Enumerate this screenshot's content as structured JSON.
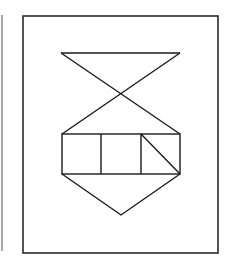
{
  "diagram": {
    "colors": {
      "stroke": "#1a1a1a",
      "frame": "#2a2a2a",
      "left_rule": "#a8a8a8",
      "background": "#ffffff"
    },
    "frame": {
      "x": 23,
      "y": 16,
      "width": 195,
      "height": 237
    },
    "shapes": {
      "top_bar": {
        "x1": 61,
        "y1": 53,
        "x2": 180,
        "y2": 53
      },
      "diagonal_left_to_right": {
        "x1": 61,
        "y1": 53,
        "x2": 180,
        "y2": 134
      },
      "diagonal_right_to_left": {
        "x1": 180,
        "y1": 53,
        "x2": 62,
        "y2": 134
      },
      "crossing_point": {
        "x": 121,
        "y": 94
      },
      "rectangle": {
        "x": 62,
        "y": 134,
        "width": 118,
        "height": 40
      },
      "dividers": [
        {
          "x1": 101,
          "y1": 134,
          "x2": 101,
          "y2": 174
        },
        {
          "x1": 141,
          "y1": 134,
          "x2": 141,
          "y2": 174
        }
      ],
      "cell_diagonal": {
        "x1": 141,
        "y1": 134,
        "x2": 180,
        "y2": 174
      },
      "bottom_triangle": {
        "points": [
          [
            62,
            174
          ],
          [
            121,
            215
          ],
          [
            180,
            174
          ]
        ]
      }
    }
  }
}
